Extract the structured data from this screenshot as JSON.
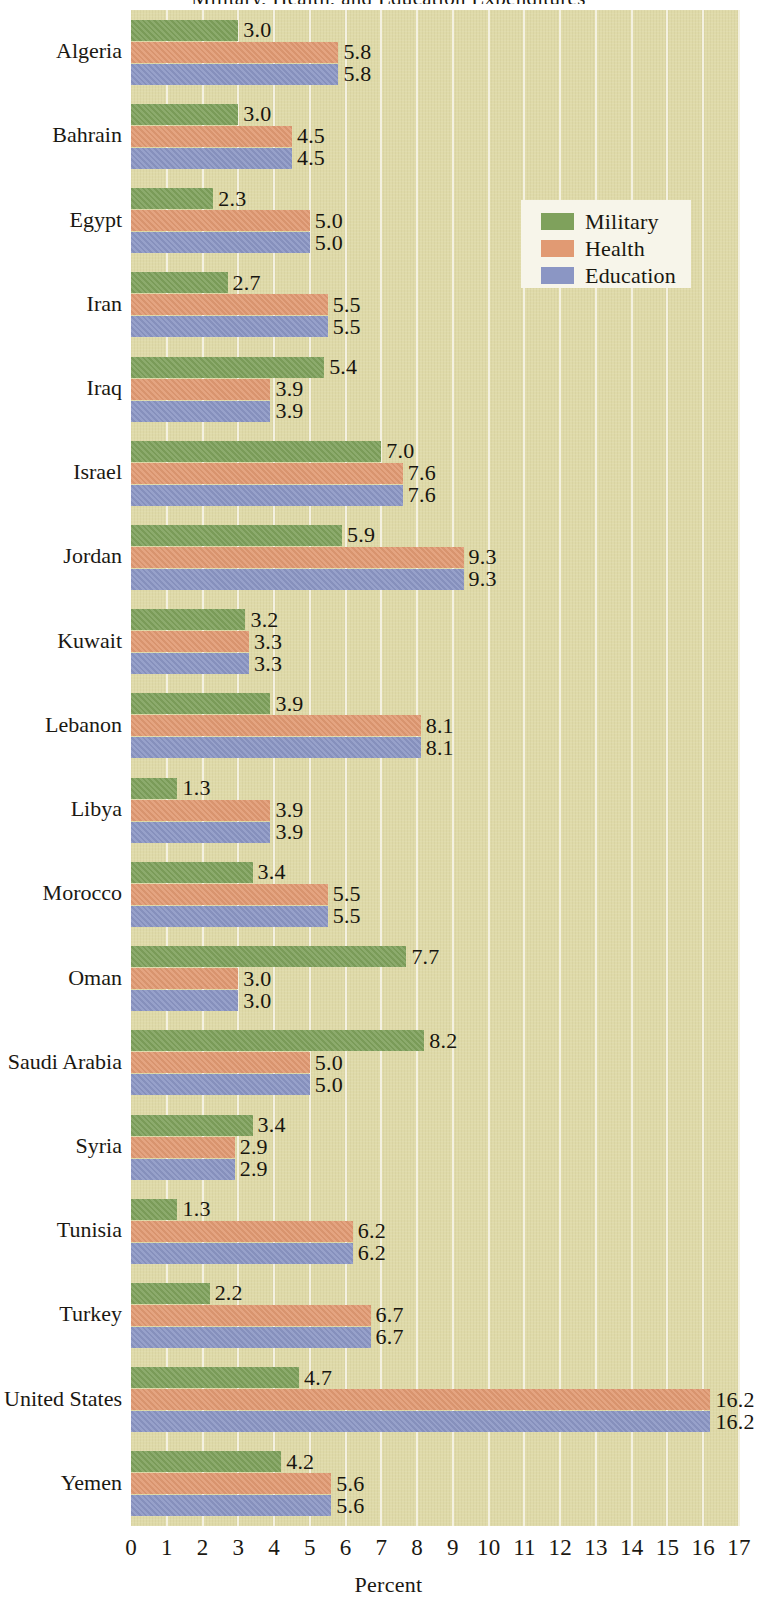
{
  "chart_data": {
    "type": "bar",
    "orientation": "horizontal",
    "title": "Military, Health, and Education Expenditures",
    "xlabel": "Percent",
    "ylabel": "",
    "xlim": [
      0,
      17
    ],
    "xticks": [
      "0",
      "1",
      "2",
      "3",
      "4",
      "5",
      "6",
      "7",
      "8",
      "9",
      "10",
      "11",
      "12",
      "13",
      "14",
      "15",
      "16",
      "17"
    ],
    "grid": true,
    "legend_position": "upper right",
    "categories": [
      "Algeria",
      "Bahrain",
      "Egypt",
      "Iran",
      "Iraq",
      "Israel",
      "Jordan",
      "Kuwait",
      "Lebanon",
      "Libya",
      "Morocco",
      "Oman",
      "Saudi Arabia",
      "Syria",
      "Tunisia",
      "Turkey",
      "United States",
      "Yemen"
    ],
    "series": [
      {
        "name": "Military",
        "color": "#7fa15c",
        "values": [
          3.0,
          3.0,
          2.3,
          2.7,
          5.4,
          7.0,
          5.9,
          3.2,
          3.9,
          1.3,
          3.4,
          7.7,
          8.2,
          3.4,
          1.3,
          2.2,
          4.7,
          4.2
        ],
        "labels": [
          "3.0",
          "3.0",
          "2.3",
          "2.7",
          "5.4",
          "7.0",
          "5.9",
          "3.2",
          "3.9",
          "1.3",
          "3.4",
          "7.7",
          "8.2",
          "3.4",
          "1.3",
          "2.2",
          "4.7",
          "4.2"
        ]
      },
      {
        "name": "Health",
        "color": "#e19a73",
        "values": [
          5.8,
          4.5,
          5.0,
          5.5,
          3.9,
          7.6,
          9.3,
          3.3,
          8.1,
          3.9,
          5.5,
          3.0,
          5.0,
          2.9,
          6.2,
          6.7,
          16.2,
          5.6
        ],
        "labels": [
          "5.8",
          "4.5",
          "5.0",
          "5.5",
          "3.9",
          "7.6",
          "9.3",
          "3.3",
          "8.1",
          "3.9",
          "5.5",
          "3.0",
          "5.0",
          "2.9",
          "6.2",
          "6.7",
          "16.2",
          "5.6"
        ]
      },
      {
        "name": "Education",
        "color": "#8b96c4",
        "values": [
          5.8,
          4.5,
          5.0,
          5.5,
          3.9,
          7.6,
          9.3,
          3.3,
          8.1,
          3.9,
          5.5,
          3.0,
          5.0,
          2.9,
          6.2,
          6.7,
          16.2,
          5.6
        ],
        "labels": [
          "5.8",
          "4.5",
          "5.0",
          "5.5",
          "3.9",
          "7.6",
          "9.3",
          "3.3",
          "8.1",
          "3.9",
          "5.5",
          "3.0",
          "5.0",
          "2.9",
          "6.2",
          "6.7",
          "16.2",
          "5.6"
        ]
      }
    ],
    "plot_background": "#dfdaa9",
    "gridline_color": "#f4f1e0",
    "legend_background": "#f7f5ea"
  },
  "legend": {
    "items": [
      {
        "label": "Military",
        "swatch": "military-swatch"
      },
      {
        "label": "Health",
        "swatch": "health-swatch"
      },
      {
        "label": "Education",
        "swatch": "education-swatch"
      }
    ]
  },
  "axis": {
    "x_title": "Percent"
  }
}
